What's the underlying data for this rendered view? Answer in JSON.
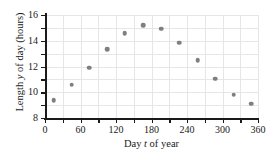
{
  "chart_data": {
    "type": "scatter",
    "title": "",
    "xlabel": "Day t of year",
    "ylabel": "Length y of day (hours)",
    "xlabel_parts": {
      "pre": "Day ",
      "italic": "t",
      "post": " of year"
    },
    "ylabel_parts": {
      "pre": "Length ",
      "italic": "y",
      "post": " of day (hours)"
    },
    "xlim": [
      0,
      360
    ],
    "ylim": [
      8,
      16
    ],
    "xticks": [
      0,
      60,
      120,
      180,
      240,
      300,
      360
    ],
    "xticklabels": [
      "0",
      "60",
      "120",
      "180",
      "240",
      "300",
      "360"
    ],
    "xminorticks": [
      30,
      90,
      150,
      210,
      270,
      330
    ],
    "yticks": [
      8,
      10,
      12,
      14,
      16
    ],
    "yticklabels": [
      "8",
      "10",
      "12",
      "14",
      "16"
    ],
    "yminorticks": [
      9,
      11,
      13,
      15
    ],
    "grid": true,
    "grid_color": "#e6e6e6",
    "marker_color": "#7f7f7f",
    "axis_color": "#1a1a1a",
    "legend": null,
    "x": [
      15,
      45,
      75,
      105,
      135,
      166,
      196,
      227,
      258,
      288,
      319,
      349
    ],
    "y": [
      9.4,
      10.6,
      11.9,
      13.35,
      14.6,
      15.2,
      14.95,
      13.85,
      12.5,
      11.05,
      9.8,
      9.1
    ],
    "points": [
      {
        "t": 15,
        "hours": 9.4
      },
      {
        "t": 45,
        "hours": 10.6
      },
      {
        "t": 75,
        "hours": 11.9
      },
      {
        "t": 105,
        "hours": 13.35
      },
      {
        "t": 135,
        "hours": 14.6
      },
      {
        "t": 166,
        "hours": 15.2
      },
      {
        "t": 196,
        "hours": 14.95
      },
      {
        "t": 227,
        "hours": 13.85
      },
      {
        "t": 258,
        "hours": 12.5
      },
      {
        "t": 288,
        "hours": 11.05
      },
      {
        "t": 319,
        "hours": 9.8
      },
      {
        "t": 349,
        "hours": 9.1
      }
    ]
  }
}
